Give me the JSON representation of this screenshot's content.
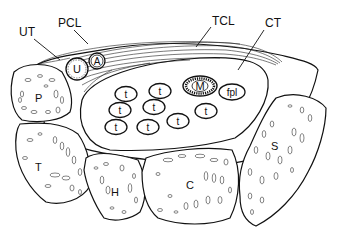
{
  "diagram": {
    "callouts": [
      {
        "id": "UT",
        "label": "UT",
        "x": 20,
        "y": 30
      },
      {
        "id": "PCL",
        "label": "PCL",
        "x": 58,
        "y": 24
      },
      {
        "id": "TCL",
        "label": "TCL",
        "x": 212,
        "y": 24
      },
      {
        "id": "CT",
        "label": "CT",
        "x": 265,
        "y": 27
      }
    ],
    "structures": {
      "U": "U",
      "A": "A",
      "M": "M",
      "fpl": "fpl",
      "t": "t"
    },
    "bones": [
      {
        "id": "P",
        "label": "P",
        "x": 35,
        "y": 98
      },
      {
        "id": "T",
        "label": "T",
        "x": 39,
        "y": 167
      },
      {
        "id": "H",
        "label": "H",
        "x": 115,
        "y": 192
      },
      {
        "id": "C",
        "label": "C",
        "x": 190,
        "y": 185
      },
      {
        "id": "S",
        "label": "S",
        "x": 275,
        "y": 146
      }
    ],
    "tendons": [
      {
        "x": 126,
        "y": 94
      },
      {
        "x": 160,
        "y": 91
      },
      {
        "x": 120,
        "y": 110
      },
      {
        "x": 154,
        "y": 107
      },
      {
        "x": 117,
        "y": 126
      },
      {
        "x": 152,
        "y": 127
      },
      {
        "x": 183,
        "y": 122
      },
      {
        "x": 207,
        "y": 113
      }
    ],
    "colors": {
      "line": "#111111",
      "background": "#ffffff",
      "hatch": "#222222"
    }
  }
}
